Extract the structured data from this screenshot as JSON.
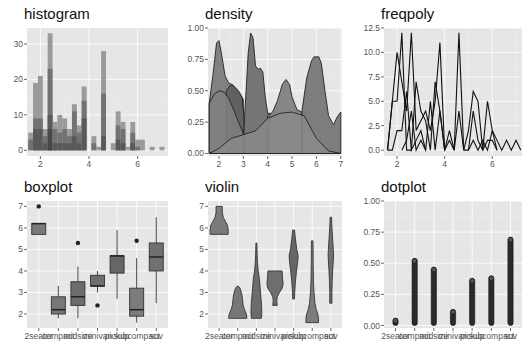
{
  "chart_data": [
    {
      "type": "bar",
      "title": "histogram",
      "xlabel": "",
      "ylabel": "",
      "xlim": [
        1.45,
        7.25
      ],
      "ylim": [
        -1.6,
        34.5
      ],
      "xticks": [
        2,
        4,
        6
      ],
      "xtick_labels": [
        "2",
        "4",
        "6"
      ],
      "yticks": [
        0,
        10,
        20,
        30
      ],
      "ytick_labels": [
        "0",
        "10",
        "20",
        "30"
      ],
      "grid": true,
      "binwidth": 0.2,
      "bins": [
        {
          "x": 1.6,
          "total": 5,
          "layers": [
            5,
            3
          ]
        },
        {
          "x": 1.8,
          "total": 19,
          "layers": [
            19,
            9,
            6
          ]
        },
        {
          "x": 2.0,
          "total": 21,
          "layers": [
            21,
            9,
            6
          ]
        },
        {
          "x": 2.2,
          "total": 6,
          "layers": [
            6,
            4,
            2
          ]
        },
        {
          "x": 2.4,
          "total": 33,
          "layers": [
            33,
            23,
            10,
            6
          ]
        },
        {
          "x": 2.6,
          "total": 8,
          "layers": [
            8,
            6,
            2
          ]
        },
        {
          "x": 2.8,
          "total": 10,
          "layers": [
            10,
            5,
            2
          ]
        },
        {
          "x": 3.0,
          "total": 9,
          "layers": [
            9,
            6,
            2
          ]
        },
        {
          "x": 3.2,
          "total": 6,
          "layers": [
            6,
            4,
            2
          ]
        },
        {
          "x": 3.4,
          "total": 13,
          "layers": [
            13,
            11,
            4
          ]
        },
        {
          "x": 3.6,
          "total": 7,
          "layers": [
            7,
            5,
            2
          ]
        },
        {
          "x": 3.8,
          "total": 18,
          "layers": [
            18,
            14,
            9
          ]
        },
        {
          "x": 4.2,
          "total": 4,
          "layers": [
            4,
            2
          ]
        },
        {
          "x": 4.4,
          "total": 1,
          "layers": [
            1
          ]
        },
        {
          "x": 4.6,
          "total": 28,
          "layers": [
            28,
            16,
            4
          ]
        },
        {
          "x": 5.0,
          "total": 2,
          "layers": [
            2
          ]
        },
        {
          "x": 5.2,
          "total": 11,
          "layers": [
            11,
            7,
            3
          ]
        },
        {
          "x": 5.4,
          "total": 8,
          "layers": [
            8,
            6,
            2
          ]
        },
        {
          "x": 5.6,
          "total": 1,
          "layers": [
            1
          ]
        },
        {
          "x": 5.8,
          "total": 8,
          "layers": [
            8,
            5,
            2
          ]
        },
        {
          "x": 6.0,
          "total": 3,
          "layers": [
            3,
            1
          ]
        },
        {
          "x": 6.2,
          "total": 3,
          "layers": [
            3
          ]
        },
        {
          "x": 6.6,
          "total": 1,
          "layers": [
            1
          ]
        },
        {
          "x": 7.0,
          "total": 1,
          "layers": [
            1
          ]
        }
      ]
    },
    {
      "type": "area",
      "title": "density",
      "xlabel": "",
      "ylabel": "",
      "xlim": [
        1.55,
        7.05
      ],
      "ylim": [
        -0.02,
        1.0
      ],
      "xticks": [
        2,
        3,
        4,
        5,
        6,
        7
      ],
      "xtick_labels": [
        "2",
        "3",
        "4",
        "5",
        "6",
        "7"
      ],
      "yticks": [
        0,
        0.25,
        0.5,
        0.75,
        1.0
      ],
      "ytick_labels": [
        "0.00",
        "0.25",
        "0.50",
        "0.75",
        "1.00"
      ],
      "grid": true,
      "series": [
        {
          "name": "a",
          "shade": "#6f6f6f",
          "x": [
            1.6,
            1.75,
            1.9,
            2.0,
            2.1,
            2.25,
            2.4,
            2.55,
            2.7,
            2.9,
            3.0
          ],
          "y": [
            0.4,
            0.62,
            0.88,
            0.9,
            0.8,
            0.62,
            0.56,
            0.55,
            0.51,
            0.46,
            0.43
          ]
        },
        {
          "name": "b",
          "shade": "#5c5c5c",
          "x": [
            2.3,
            2.45,
            2.6,
            2.8,
            2.95,
            3.05
          ],
          "y": [
            0.5,
            0.54,
            0.54,
            0.5,
            0.45,
            0.25
          ]
        },
        {
          "name": "c",
          "shade": "#808080",
          "x": [
            1.6,
            1.8,
            2.0,
            2.2,
            2.4,
            2.6,
            2.8,
            3.0,
            3.1
          ],
          "y": [
            0.4,
            0.47,
            0.5,
            0.49,
            0.44,
            0.35,
            0.25,
            0.16,
            0.14
          ]
        },
        {
          "name": "d",
          "shade": "#606060",
          "x": [
            3.0,
            3.1,
            3.2,
            3.3,
            3.4,
            3.5,
            3.6,
            3.7,
            3.8,
            3.9,
            4.0,
            4.1
          ],
          "y": [
            0.14,
            0.45,
            0.8,
            0.96,
            0.92,
            0.7,
            0.67,
            0.68,
            0.65,
            0.45,
            0.32,
            0.32
          ]
        },
        {
          "name": "e",
          "shade": "#767676",
          "x": [
            4.0,
            4.2,
            4.4,
            4.6,
            4.75,
            4.9,
            5.0,
            5.2,
            5.4
          ],
          "y": [
            0.3,
            0.33,
            0.42,
            0.55,
            0.59,
            0.55,
            0.45,
            0.35,
            0.33
          ]
        },
        {
          "name": "f",
          "shade": "#6a6a6a",
          "x": [
            5.4,
            5.6,
            5.8,
            5.9,
            6.0,
            6.1,
            6.2,
            6.35,
            6.5,
            6.7,
            6.85,
            7.0
          ],
          "y": [
            0.33,
            0.6,
            0.74,
            0.77,
            0.77,
            0.77,
            0.72,
            0.5,
            0.3,
            0.23,
            0.29,
            0.33
          ]
        },
        {
          "name": "g",
          "shade": "#8a8a8a",
          "x": [
            1.6,
            2.0,
            2.5,
            3.0,
            3.5,
            4.0,
            4.5,
            5.0,
            5.5,
            6.0,
            6.5,
            7.0
          ],
          "y": [
            0.0,
            0.04,
            0.12,
            0.15,
            0.18,
            0.28,
            0.32,
            0.33,
            0.3,
            0.12,
            0.02,
            0.0
          ]
        }
      ]
    },
    {
      "type": "line",
      "title": "freqpoly",
      "xlabel": "",
      "ylabel": "",
      "xlim": [
        1.45,
        7.25
      ],
      "ylim": [
        -0.6,
        12.5
      ],
      "xticks": [
        2,
        4,
        6
      ],
      "xtick_labels": [
        "2",
        "4",
        "6"
      ],
      "yticks": [
        0,
        2.5,
        5,
        7.5,
        10,
        12.5
      ],
      "ytick_labels": [
        "0.0",
        "2.5",
        "5.0",
        "7.5",
        "10.0",
        "12.5"
      ],
      "grid": true,
      "series": [
        {
          "name": "s1",
          "x": [
            1.6,
            1.8,
            2.0,
            2.2,
            2.4,
            2.6,
            2.8,
            3.0,
            3.2,
            3.4,
            3.6,
            3.8,
            4.0,
            4.2,
            4.4,
            4.6,
            4.8
          ],
          "y": [
            0,
            5,
            5,
            12,
            0,
            0,
            7,
            4,
            3,
            0,
            7,
            4,
            0,
            2,
            0,
            12,
            0
          ]
        },
        {
          "name": "s2",
          "x": [
            1.6,
            1.8,
            2.0,
            2.2,
            2.4,
            2.6,
            2.8,
            3.0,
            3.2,
            3.4,
            3.6,
            3.8,
            4.0
          ],
          "y": [
            0,
            5,
            10,
            7,
            4,
            12,
            2,
            3,
            4,
            2,
            5,
            11,
            0
          ]
        },
        {
          "name": "s3",
          "x": [
            1.6,
            1.8,
            2.0,
            2.2,
            2.4,
            2.6,
            2.8,
            3.0,
            3.2
          ],
          "y": [
            0,
            0,
            2,
            2,
            6,
            0,
            1,
            2,
            0
          ]
        },
        {
          "name": "s4",
          "x": [
            2.2,
            2.4,
            2.6,
            2.8,
            3.0,
            3.2,
            3.4,
            3.6,
            3.8,
            4.0,
            4.2,
            4.4
          ],
          "y": [
            0,
            1,
            4,
            0,
            1,
            0,
            5,
            0,
            4,
            0,
            1,
            0
          ]
        },
        {
          "name": "s5",
          "x": [
            4.4,
            4.6,
            4.8,
            5.0,
            5.2,
            5.4,
            5.6,
            5.8,
            6.0,
            6.2,
            6.4,
            6.6,
            6.8,
            7.0,
            7.2
          ],
          "y": [
            0,
            4,
            0,
            2,
            6,
            5,
            0,
            5,
            2,
            1,
            0,
            1,
            0,
            1,
            0
          ]
        },
        {
          "name": "s6",
          "x": [
            4.8,
            5.0,
            5.2,
            5.4,
            5.6,
            5.8,
            6.0,
            6.2
          ],
          "y": [
            0,
            0,
            4,
            1,
            0,
            1,
            1,
            0
          ]
        },
        {
          "name": "s7",
          "x": [
            5.0,
            5.2,
            5.4,
            5.6,
            5.8,
            6.0,
            6.2
          ],
          "y": [
            0,
            1,
            0,
            1,
            0,
            2,
            0
          ]
        }
      ]
    },
    {
      "type": "box",
      "title": "boxplot",
      "xlabel": "",
      "ylabel": "",
      "categories": [
        "2seater",
        "compact",
        "midsize",
        "minivan",
        "pickup",
        "subcompact",
        "suv"
      ],
      "ylim": [
        1.35,
        7.25
      ],
      "yticks": [
        2,
        3,
        4,
        5,
        6,
        7
      ],
      "ytick_labels": [
        "2",
        "3",
        "4",
        "5",
        "6",
        "7"
      ],
      "grid": true,
      "boxes": [
        {
          "low": 5.7,
          "q1": 5.7,
          "median": 6.2,
          "q3": 6.2,
          "high": 6.2,
          "outliers": [
            7.0
          ],
          "shade": "#7a7a7a"
        },
        {
          "low": 1.8,
          "q1": 2.0,
          "median": 2.2,
          "q3": 2.8,
          "high": 3.3,
          "outliers": [],
          "shade": "#777777"
        },
        {
          "low": 1.8,
          "q1": 2.4,
          "median": 2.8,
          "q3": 3.5,
          "high": 4.2,
          "outliers": [
            5.3
          ],
          "shade": "#6c6c6c"
        },
        {
          "low": 3.0,
          "q1": 3.3,
          "median": 3.3,
          "q3": 3.8,
          "high": 4.0,
          "outliers": [
            2.4
          ],
          "shade": "#6e6e6e"
        },
        {
          "low": 2.7,
          "q1": 3.9,
          "median": 4.7,
          "q3": 4.7,
          "high": 5.9,
          "outliers": [],
          "shade": "#666666"
        },
        {
          "low": 1.6,
          "q1": 1.9,
          "median": 2.2,
          "q3": 3.2,
          "high": 4.6,
          "outliers": [
            5.4
          ],
          "shade": "#7c7c7c"
        },
        {
          "low": 2.5,
          "q1": 4.0,
          "median": 4.65,
          "q3": 5.3,
          "high": 6.5,
          "outliers": [],
          "shade": "#707070"
        }
      ]
    },
    {
      "type": "violin",
      "title": "violin",
      "xlabel": "",
      "ylabel": "",
      "categories": [
        "2seater",
        "compact",
        "midsize",
        "minivan",
        "pickup",
        "subcompact",
        "suv"
      ],
      "ylim": [
        1.35,
        7.25
      ],
      "yticks": [
        2,
        3,
        4,
        5,
        6,
        7
      ],
      "ytick_labels": [
        "2",
        "3",
        "4",
        "5",
        "6",
        "7"
      ],
      "grid": true,
      "violins": [
        {
          "y": [
            5.7,
            5.9,
            6.1,
            6.3,
            6.5,
            6.7,
            6.9,
            7.0
          ],
          "w": [
            1.0,
            1.0,
            0.95,
            0.7,
            0.45,
            0.35,
            0.35,
            0.35
          ],
          "shade": "#7a7a7a"
        },
        {
          "y": [
            1.8,
            1.9,
            2.0,
            2.2,
            2.4,
            2.6,
            2.8,
            3.0,
            3.2,
            3.3
          ],
          "w": [
            1.0,
            1.0,
            0.95,
            0.75,
            0.6,
            0.55,
            0.5,
            0.4,
            0.25,
            0.05
          ],
          "shade": "#777777"
        },
        {
          "y": [
            1.8,
            2.0,
            2.4,
            2.8,
            3.2,
            3.6,
            4.0,
            4.4,
            4.8,
            5.3
          ],
          "w": [
            0.55,
            0.6,
            0.58,
            0.5,
            0.42,
            0.35,
            0.2,
            0.12,
            0.08,
            0.05
          ],
          "shade": "#6c6c6c"
        },
        {
          "y": [
            2.4,
            2.6,
            2.8,
            3.0,
            3.2,
            3.4,
            3.6,
            3.8,
            4.0
          ],
          "w": [
            0.25,
            0.2,
            0.25,
            0.5,
            0.8,
            0.9,
            0.85,
            0.82,
            0.78
          ],
          "shade": "#6e6e6e"
        },
        {
          "y": [
            2.7,
            3.0,
            3.5,
            4.0,
            4.4,
            4.7,
            5.0,
            5.5,
            5.9
          ],
          "w": [
            0.1,
            0.12,
            0.2,
            0.32,
            0.45,
            0.5,
            0.35,
            0.2,
            0.1
          ],
          "shade": "#666666"
        },
        {
          "y": [
            1.6,
            1.8,
            2.0,
            2.2,
            2.5,
            3.0,
            3.5,
            4.0,
            4.5,
            5.0,
            5.4
          ],
          "w": [
            0.7,
            0.7,
            0.62,
            0.45,
            0.3,
            0.2,
            0.14,
            0.12,
            0.1,
            0.1,
            0.08
          ],
          "shade": "#7c7c7c"
        },
        {
          "y": [
            2.5,
            3.0,
            3.5,
            4.0,
            4.5,
            4.8,
            5.0,
            5.5,
            6.0,
            6.5
          ],
          "w": [
            0.12,
            0.12,
            0.15,
            0.2,
            0.28,
            0.3,
            0.27,
            0.2,
            0.12,
            0.08
          ],
          "shade": "#707070"
        }
      ]
    },
    {
      "type": "dotplot",
      "title": "dotplot",
      "xlabel": "",
      "ylabel": "",
      "categories": [
        "2seater",
        "compact",
        "midsize",
        "minivan",
        "pickup",
        "subcompact",
        "suv"
      ],
      "ylim": [
        -0.02,
        1.0
      ],
      "yticks": [
        0,
        0.25,
        0.5,
        0.75,
        1.0
      ],
      "ytick_labels": [
        "0.00",
        "0.25",
        "0.50",
        "0.75",
        "1.00"
      ],
      "grid": true,
      "stack_heights": [
        0.06,
        0.54,
        0.47,
        0.13,
        0.38,
        0.4,
        0.71
      ]
    }
  ]
}
